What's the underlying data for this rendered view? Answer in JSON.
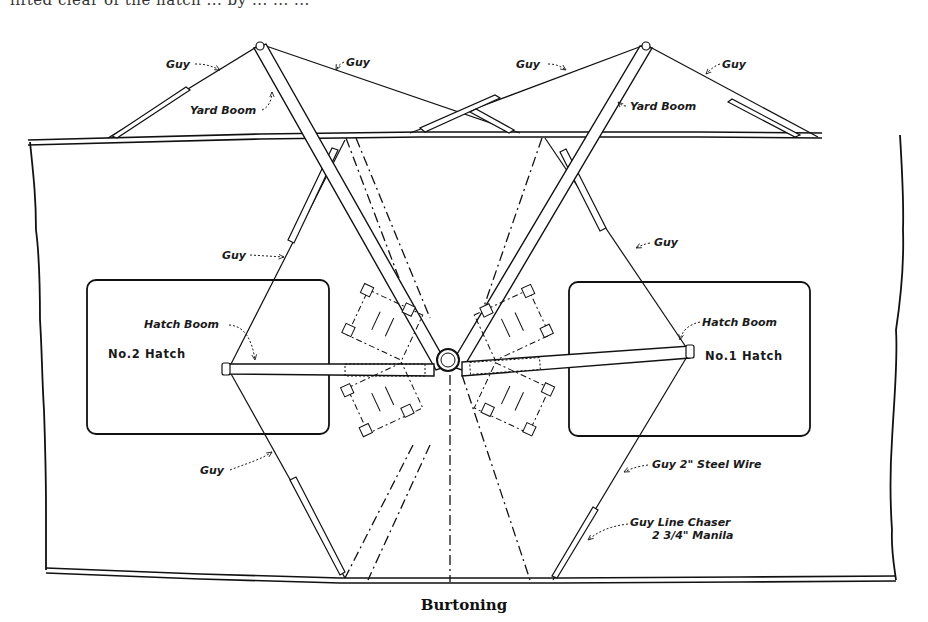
{
  "page": {
    "top_text_fragment": "lifted clear of the hatch ... by ... ... ...",
    "caption": "Burtoning"
  },
  "diagram": {
    "title": "Burtoning",
    "hatches": [
      {
        "id": "no2",
        "label": "No.2 Hatch"
      },
      {
        "id": "no1",
        "label": "No.1 Hatch"
      }
    ],
    "labels": {
      "guy_top_left_1": "Guy",
      "guy_top_left_2": "Guy",
      "yard_boom_left": "Yard Boom",
      "guy_top_right_1": "Guy",
      "guy_top_right_2": "Guy",
      "yard_boom_right": "Yard Boom",
      "guy_mid_left": "Guy",
      "guy_mid_right": "Guy",
      "hatch_boom_left": "Hatch Boom",
      "hatch_boom_right": "Hatch Boom",
      "guy_low_left": "Guy",
      "guy_steel_wire": "Guy 2\" Steel Wire",
      "guy_line_chaser_1": "Guy Line Chaser",
      "guy_line_chaser_2": "2 3/4\" Manila"
    },
    "components": [
      "ship-deck",
      "port-rail",
      "starboard-rail",
      "yard-booms",
      "hatch-booms",
      "guys",
      "winches",
      "mast",
      "cargo-falls"
    ]
  }
}
